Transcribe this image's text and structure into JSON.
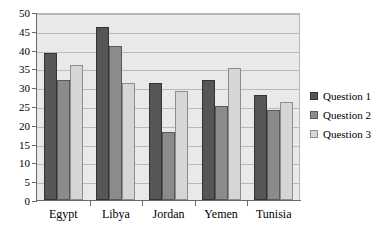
{
  "chart_data": {
    "type": "bar",
    "title": "",
    "subtitle": "",
    "xlabel": "",
    "ylabel": "",
    "categories": [
      "Egypt",
      "Libya",
      "Jordan",
      "Yemen",
      "Tunisia"
    ],
    "series": [
      {
        "name": "Question 1",
        "color": "#565656",
        "values": [
          39,
          46,
          31,
          32,
          28
        ]
      },
      {
        "name": "Question 2",
        "color": "#8b8b8b",
        "values": [
          32,
          41,
          18,
          25,
          24
        ]
      },
      {
        "name": "Question 3",
        "color": "#d6d6d6",
        "values": [
          36,
          31,
          29,
          35,
          26
        ]
      }
    ],
    "ylim": [
      0,
      50
    ],
    "ytick_step": 5,
    "yticks": [
      0,
      5,
      10,
      15,
      20,
      25,
      30,
      35,
      40,
      45,
      50
    ],
    "grid": true,
    "grid_axis": "y",
    "legend_position": "right",
    "orientation": "vertical",
    "grouping": "clustered",
    "plot_background": "#e9e9e9",
    "grid_color": "#b9b9b9",
    "axis_color": "#6a6a6a"
  }
}
